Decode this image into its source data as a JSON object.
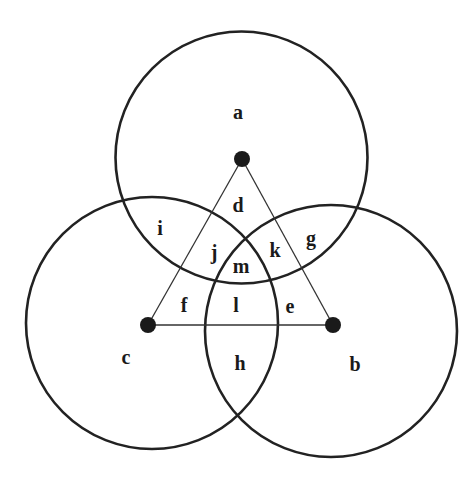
{
  "diagram": {
    "type": "three-circle venn diagram with triangle",
    "colors": {
      "background": "#ffffff",
      "stroke": "#222222",
      "dot": "#1a1a1a",
      "text": "#1a1a1a"
    },
    "circles": [
      {
        "id": "a",
        "cx": 241.5,
        "cy": 157.5,
        "r": 126
      },
      {
        "id": "b",
        "cx": 331,
        "cy": 331,
        "r": 126
      },
      {
        "id": "c",
        "cx": 152,
        "cy": 323,
        "r": 126
      }
    ],
    "points": [
      {
        "id": "a",
        "x": 242,
        "y": 159,
        "r": 8
      },
      {
        "id": "b",
        "x": 333,
        "y": 325,
        "r": 8
      },
      {
        "id": "c",
        "x": 148,
        "y": 325,
        "r": 8
      }
    ],
    "triangle_edges": [
      {
        "from": "a",
        "to": "b"
      },
      {
        "from": "b",
        "to": "c"
      },
      {
        "from": "c",
        "to": "a"
      }
    ],
    "labels": [
      {
        "text": "a",
        "x": 238,
        "y": 112
      },
      {
        "text": "d",
        "x": 238,
        "y": 205
      },
      {
        "text": "i",
        "x": 160,
        "y": 228
      },
      {
        "text": "g",
        "x": 311,
        "y": 238
      },
      {
        "text": "j",
        "x": 214,
        "y": 252
      },
      {
        "text": "k",
        "x": 275,
        "y": 250
      },
      {
        "text": "m",
        "x": 241,
        "y": 266
      },
      {
        "text": "f",
        "x": 184,
        "y": 305
      },
      {
        "text": "l",
        "x": 236,
        "y": 305
      },
      {
        "text": "e",
        "x": 290,
        "y": 306
      },
      {
        "text": "c",
        "x": 126,
        "y": 357
      },
      {
        "text": "h",
        "x": 240,
        "y": 363
      },
      {
        "text": "b",
        "x": 355,
        "y": 364
      }
    ]
  }
}
